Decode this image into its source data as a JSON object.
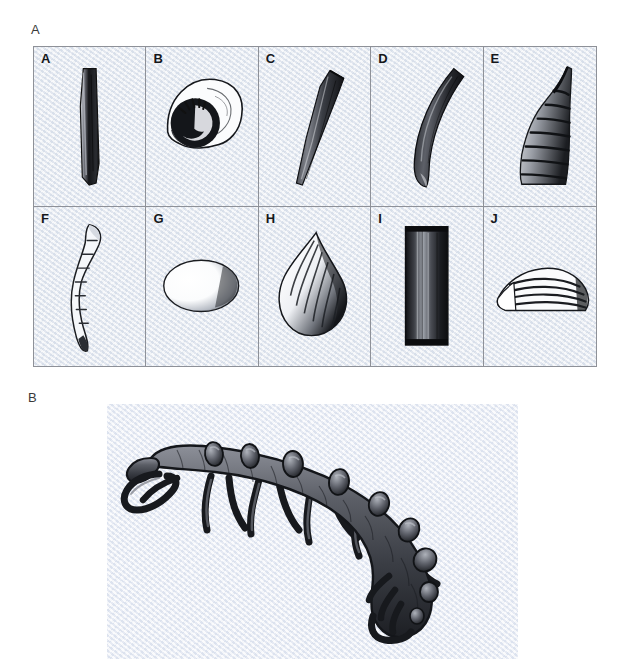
{
  "figure": {
    "panels": [
      {
        "id": "A",
        "label": "A",
        "caption_type": "fossil-plate"
      },
      {
        "id": "B",
        "label": "B",
        "caption_type": "reconstruction"
      }
    ]
  },
  "panel_a": {
    "label": "A",
    "rows": 2,
    "columns": 5,
    "background_color": "#e9edf3",
    "border_color": "#8e9198",
    "ink_color": "#1a1a1a",
    "cells": [
      {
        "letter": "A",
        "shape": "elongate-straight-tube-spine",
        "orientation": "vertical"
      },
      {
        "letter": "B",
        "shape": "coiled-spiral-gastropod-shell",
        "orientation": "planispiral"
      },
      {
        "letter": "C",
        "shape": "tapering-cone-sclerite",
        "orientation": "oblique"
      },
      {
        "letter": "D",
        "shape": "curved-claw-sclerite",
        "orientation": "arched"
      },
      {
        "letter": "E",
        "shape": "ribbed-curved-horn",
        "orientation": "upright-hooked"
      },
      {
        "letter": "F",
        "shape": "segmented-sinuous-sclerite",
        "orientation": "vertical-wavy"
      },
      {
        "letter": "G",
        "shape": "smooth-oval-valve",
        "orientation": "horizontal"
      },
      {
        "letter": "H",
        "shape": "ribbed-teardrop-brachiopod-valve",
        "orientation": "apex-up"
      },
      {
        "letter": "I",
        "shape": "rectangular-dark-tube",
        "orientation": "vertical"
      },
      {
        "letter": "J",
        "shape": "striated-fan-wedge-valve",
        "orientation": "horizontal"
      }
    ]
  },
  "panel_b": {
    "label": "B",
    "background_color": "#eceff6",
    "ink_color": "#1f2024",
    "subject": "lobopodian-reconstruction",
    "body": {
      "posture": "arched-curved-body",
      "head_end": "left",
      "tail_end": "lower-right"
    },
    "features": {
      "dorsal_spine_count": 9,
      "leg_pair_count": 8,
      "appendage_type": "tubular-legs",
      "head_appendage": "paired-loop-appendage"
    }
  }
}
